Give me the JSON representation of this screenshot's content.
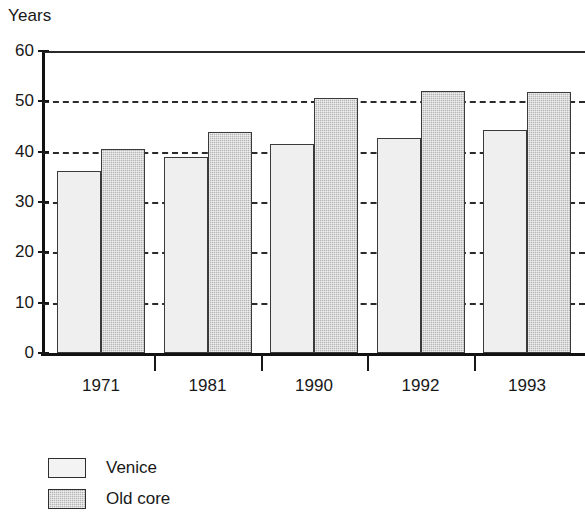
{
  "chart_data": {
    "type": "bar",
    "title": "",
    "ylabel": "Years",
    "xlabel": "",
    "categories": [
      "1971",
      "1981",
      "1990",
      "1992",
      "1993"
    ],
    "series": [
      {
        "name": "Venice",
        "values": [
          36.1,
          38.9,
          41.6,
          42.7,
          44.4
        ]
      },
      {
        "name": "Old core",
        "values": [
          40.5,
          43.9,
          50.6,
          52.0,
          51.9
        ]
      }
    ],
    "ylim": [
      0,
      60
    ],
    "yticks": [
      0,
      10,
      20,
      30,
      40,
      50,
      60
    ],
    "ytick_labels": [
      "0",
      "10",
      "20",
      "30",
      "40",
      "50",
      "60"
    ],
    "grid": "horizontal-dashed",
    "legend_position": "below-left",
    "colors": {
      "venice_fill": "#efefef",
      "oldcore_fill": "#b4b4b4",
      "bar_outline": "#3a3a3a",
      "axis": "#111111",
      "text": "#181818",
      "background": "#ffffff"
    }
  },
  "legend": {
    "items": [
      {
        "label": "Venice",
        "swatch": "light-gray-square"
      },
      {
        "label": "Old core",
        "swatch": "medium-gray-square"
      }
    ]
  }
}
